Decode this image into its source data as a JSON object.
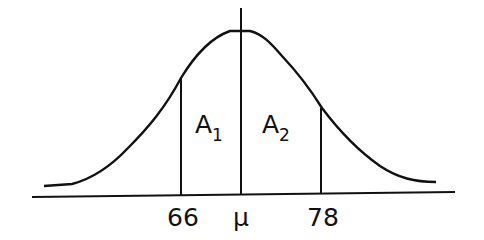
{
  "diagram": {
    "type": "normal-distribution",
    "colors": {
      "line": "#111111",
      "background": "#ffffff"
    },
    "axis_labels": {
      "left": "66",
      "mean": "μ",
      "right": "78"
    },
    "regions": [
      {
        "name": "A",
        "subscript": "1"
      },
      {
        "name": "A",
        "subscript": "2"
      }
    ]
  }
}
